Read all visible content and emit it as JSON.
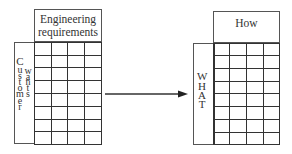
{
  "left_matrix": {
    "header": [
      "Engineering",
      "requirements"
    ],
    "side_label_1": [
      "C",
      "u",
      "s",
      "t",
      "o",
      "m",
      "e",
      "r"
    ],
    "side_label_2": [
      "w",
      "a",
      "n",
      "t",
      "s"
    ],
    "rows": 8,
    "cols": 4
  },
  "right_matrix": {
    "header": "How",
    "side_label": [
      "W",
      "H",
      "A",
      "T"
    ],
    "rows": 8,
    "cols": 4
  },
  "arrow": {
    "direction": "right"
  },
  "colors": {
    "line": "#333333",
    "background": "#ffffff"
  }
}
